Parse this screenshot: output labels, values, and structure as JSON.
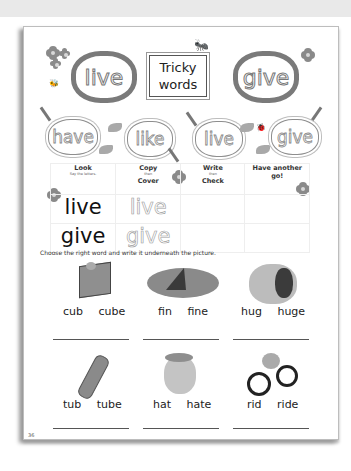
{
  "header": {
    "title_line1": "Tricky",
    "title_line2": "words"
  },
  "featured_words": [
    "live",
    "give"
  ],
  "practice_clouds": [
    "have",
    "like",
    "live",
    "give"
  ],
  "grid": {
    "columns": [
      {
        "title": "Look",
        "subtitle": "Say the letters."
      },
      {
        "title": "Copy",
        "subtitle": "then",
        "title2": "Cover"
      },
      {
        "title": "Write",
        "subtitle": "then",
        "title2": "Check"
      },
      {
        "title": "Have another",
        "title2": "go!"
      }
    ],
    "rows": [
      {
        "look": "live",
        "copy": "live"
      },
      {
        "look": "give",
        "copy": "give"
      }
    ]
  },
  "instruction": "Choose the right word and write it underneath the picture.",
  "pictures": [
    {
      "name": "cube",
      "words": "cub cube"
    },
    {
      "name": "fin",
      "words": "fin fine"
    },
    {
      "name": "hug",
      "words": "hug huge"
    },
    {
      "name": "tube",
      "words": "tub tube"
    },
    {
      "name": "hat",
      "words": "hat hate"
    },
    {
      "name": "ride",
      "words": "rid ride"
    }
  ],
  "page_number": "36",
  "colors": {
    "ink": "#222222",
    "cloud_border": "#7a7a7a",
    "page_bg": "#ffffff"
  }
}
